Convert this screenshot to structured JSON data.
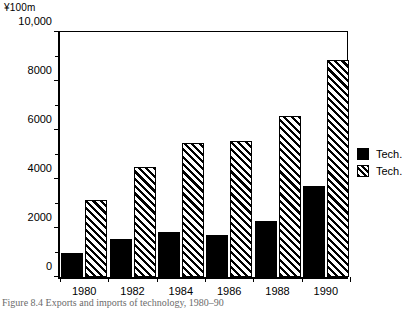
{
  "chart_data": {
    "type": "bar",
    "title": "",
    "unit_label": "¥100m",
    "xlabel": "",
    "ylabel": "",
    "categories": [
      "1980",
      "1982",
      "1984",
      "1986",
      "1988",
      "1990"
    ],
    "series": [
      {
        "name": "Tech.",
        "pattern": "solid",
        "values": [
          950,
          1550,
          1830,
          1680,
          2250,
          3650
        ]
      },
      {
        "name": "Tech.",
        "pattern": "hatched",
        "values": [
          3100,
          4450,
          5400,
          5500,
          6480,
          8750
        ]
      }
    ],
    "ylim": [
      0,
      10000
    ],
    "ymajor_ticks": [
      0,
      2000,
      4000,
      6000,
      8000,
      10000
    ],
    "ymajor_tick_labels": [
      "0",
      "2000",
      "4000",
      "6000",
      "8000",
      "10,000"
    ],
    "yminor_ticks": [
      1000,
      3000,
      5000,
      7000,
      9000
    ],
    "grid": false,
    "legend_position": "right"
  },
  "legend": {
    "entries": [
      {
        "label": "Tech.",
        "pattern": "solid"
      },
      {
        "label": "Tech.",
        "pattern": "hatched"
      }
    ]
  },
  "caption": {
    "text": "Figure 8.4 Exports and imports of technology, 1980–90"
  }
}
